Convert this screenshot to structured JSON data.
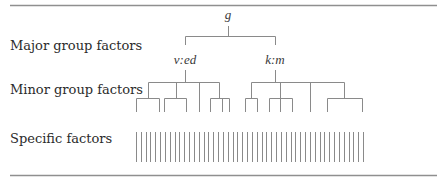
{
  "diagram": {
    "type": "hierarchical-factor-tree",
    "row_labels": {
      "major": "Major group factors",
      "minor": "Minor group factors",
      "specific": "Specific factors"
    },
    "nodes": {
      "root": "g",
      "major": [
        "v:ed",
        "k:m"
      ]
    },
    "structure": {
      "root": {
        "label": "g",
        "x": 228
      },
      "major_groups": [
        {
          "label": "v:ed",
          "x": 185,
          "minor_children": [
            {
              "x": 148,
              "leaves": [
                136,
                159
              ]
            },
            {
              "x": 176,
              "leaves": [
                164,
                186
              ]
            },
            {
              "x": 199,
              "leaves": []
            },
            {
              "x": 219,
              "leaves": [
                210,
                222,
                229
              ]
            }
          ]
        },
        {
          "label": "k:m",
          "x": 275,
          "minor_children": [
            {
              "x": 251,
              "leaves": [
                245,
                257
              ]
            },
            {
              "x": 280,
              "leaves": [
                269,
                280,
                292
              ]
            },
            {
              "x": 310,
              "leaves": []
            },
            {
              "x": 344,
              "leaves": [
                327,
                362
              ]
            }
          ]
        }
      ],
      "specific_factor_count": 48,
      "specific_x_range": [
        136,
        363
      ]
    },
    "colors": {
      "line": "#8a8a8a",
      "rule": "#8f8f8f",
      "text": "#2b2b2b"
    }
  }
}
